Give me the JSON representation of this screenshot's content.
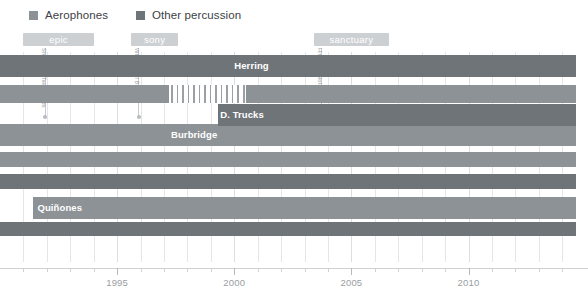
{
  "legend": {
    "items": [
      {
        "label": "Aerophones",
        "color": "#8c9296",
        "icon": "square-swatch-icon"
      },
      {
        "label": "Other percussion",
        "color": "#6f7479",
        "icon": "square-swatch-icon"
      }
    ]
  },
  "eras": [
    {
      "label": "epic",
      "start": 1991.0,
      "end": 1994.0,
      "color": "#cdd0d3"
    },
    {
      "label": "sony",
      "start": 1995.6,
      "end": 1997.6,
      "color": "#cdd0d3"
    },
    {
      "label": "sanctuary",
      "start": 2003.4,
      "end": 2006.6,
      "color": "#cdd0d3"
    }
  ],
  "albums": [
    {
      "label": "Shades of Two Worlds",
      "year": 1991.9
    },
    {
      "label": "Where It All Begins",
      "year": 1995.9
    },
    {
      "label": "Hittin' the Note",
      "year": 2003.7
    }
  ],
  "chart_data": {
    "type": "bar",
    "title": "",
    "xlabel": "",
    "ylabel": "",
    "orientation": "horizontal",
    "xlim": [
      1990.0,
      2015.1
    ],
    "grid": true,
    "legend_position": "top-left",
    "xticks_major": [
      1995,
      2000,
      2005,
      2010
    ],
    "xticks_minor": [
      1991,
      1992,
      1993,
      1994,
      1996,
      1997,
      1998,
      1999,
      2001,
      2002,
      2003,
      2004,
      2006,
      2007,
      2008,
      2009,
      2011,
      2012,
      2013,
      2014
    ],
    "xticklabels": [
      "1995",
      "2000",
      "2005",
      "2010"
    ],
    "categories": [
      "Herring",
      "D. Trucks",
      "",
      "Burbridge",
      "",
      "",
      "Quiñones",
      ""
    ],
    "series": [
      {
        "name": "Aerophones",
        "color": "#8c9296",
        "bars": [
          {
            "label": "",
            "start": 1990.0,
            "end": 2014.6,
            "row": 1
          },
          {
            "label": "Burbridge",
            "start": 1990.0,
            "end": 2014.6,
            "row": 3
          },
          {
            "label": "",
            "start": 1990.0,
            "end": 2014.6,
            "row": 4
          },
          {
            "label": "Quiñones",
            "start": 1991.4,
            "end": 2014.6,
            "row": 6
          }
        ]
      },
      {
        "name": "Other percussion",
        "color": "#6f7479",
        "bars": [
          {
            "label": "Herring",
            "start": 1990.0,
            "end": 2014.6,
            "row": 0
          },
          {
            "label": "D. Trucks",
            "start": 1999.3,
            "end": 2014.6,
            "row": 2
          },
          {
            "label": "",
            "start": 1990.0,
            "end": 2014.6,
            "row": 5
          },
          {
            "label": "",
            "start": 1990.0,
            "end": 2014.6,
            "row": 7
          }
        ]
      }
    ],
    "bar_label_positions": [
      {
        "text": "Herring",
        "year": 2000.0,
        "row": 0
      },
      {
        "text": "D. Trucks",
        "year": 1999.4,
        "row": 2
      },
      {
        "text": "Burbridge",
        "year": 1997.3,
        "row": 3
      },
      {
        "text": "Quiñones",
        "year": 1991.6,
        "row": 6
      }
    ],
    "hatched_segment": {
      "row": 1,
      "start": 1997.2,
      "end": 2000.5,
      "stripes": 14
    }
  }
}
